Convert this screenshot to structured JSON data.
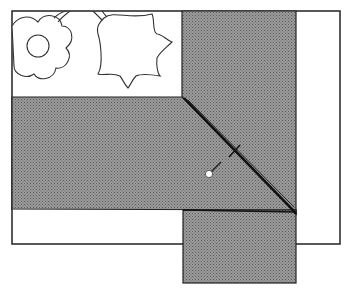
{
  "diagram": {
    "colors": {
      "background": "#ffffff",
      "fabric_fill": "#8c8c8c",
      "outline": "#222222",
      "seam": "#111111",
      "pin_head": "#ffffff"
    },
    "elements": [
      {
        "id": "outer-quilt-block",
        "label": "Appliqué block (background)"
      },
      {
        "id": "appliqué-flower",
        "label": "Round flower motif"
      },
      {
        "id": "appliqué-tulip",
        "label": "Tulip motif"
      },
      {
        "id": "vertical-border-strip",
        "label": "Vertical border strip"
      },
      {
        "id": "horizontal-border-strip",
        "label": "Horizontal border strip"
      },
      {
        "id": "miter-seam",
        "label": "Diagonal mitered seam"
      },
      {
        "id": "pin",
        "label": "Pin"
      },
      {
        "id": "tack-mark",
        "label": "Seam mark"
      }
    ]
  }
}
